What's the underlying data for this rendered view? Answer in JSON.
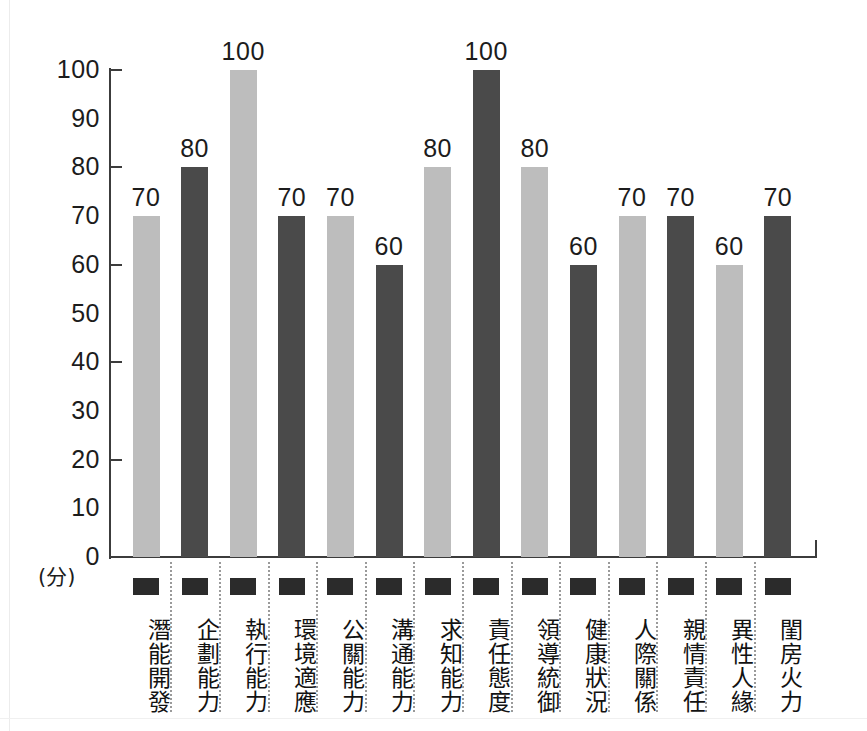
{
  "chart_data": {
    "type": "bar",
    "title": "",
    "xlabel": "",
    "ylabel": "(分)",
    "ylim": [
      0,
      100
    ],
    "ytick_step": 10,
    "ytick_labels": [
      "100",
      "90",
      "80",
      "70",
      "60",
      "50",
      "40",
      "30",
      "20",
      "10",
      "0"
    ],
    "ytick_values": [
      100,
      90,
      80,
      70,
      60,
      50,
      40,
      30,
      20,
      10,
      0
    ],
    "ticked_values": [
      100,
      80,
      60,
      40,
      20
    ],
    "grid": false,
    "legend": "none",
    "categories": [
      "潛能開發",
      "企劃能力",
      "執行能力",
      "環境適應",
      "公關能力",
      "溝通能力",
      "求知能力",
      "責任態度",
      "領導統御",
      "健康狀況",
      "人際關係",
      "親情責任",
      "異性人緣",
      "閨房火力"
    ],
    "values": [
      70,
      80,
      100,
      70,
      70,
      60,
      80,
      100,
      80,
      60,
      70,
      70,
      60,
      70
    ],
    "bar_colors": [
      "light",
      "dark",
      "light",
      "dark",
      "light",
      "dark",
      "light",
      "dark",
      "light",
      "dark",
      "light",
      "dark",
      "light",
      "dark"
    ],
    "colors": {
      "light": "#bdbdbd",
      "dark": "#4a4a4a",
      "axis": "#3c3c3c",
      "text": "#1c1c1c",
      "swatch": "#2b2b2b",
      "separator": "#9a9a9a",
      "background": "#ffffff"
    }
  }
}
